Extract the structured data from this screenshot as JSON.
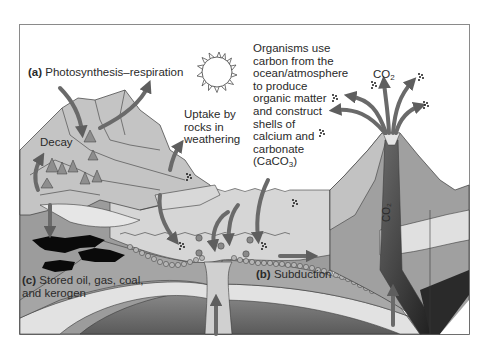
{
  "figure": {
    "type": "carbon-cycle-diagram",
    "palette": {
      "background": "#ffffff",
      "frame": "#8a8a8a",
      "rock_light": "#c8c8c8",
      "rock_mid": "#a9a9a9",
      "rock_dark": "#8c8c8c",
      "ocean": "#d4d4d4",
      "sediment": "#9a9a9a",
      "mantle": "#6e6e6e",
      "crust_band": "#e4e4e4",
      "arrow": "#6a6a6a",
      "oil": "#0a0a0a",
      "outline": "#3a3a3a",
      "text": "#2a2a2a"
    }
  },
  "labels": {
    "a_tag": "(a)",
    "a_text": "Photosynthesis–respiration",
    "decay": "Decay",
    "uptake": [
      "Uptake by",
      "rocks in",
      "weathering"
    ],
    "organisms": [
      "Organisms use",
      "carbon from the",
      "ocean/atmosphere",
      "to produce",
      "organic matter",
      "and construct",
      "shells of",
      "calcium and",
      "carbonate"
    ],
    "caco3_pre": "(CaCO",
    "caco3_sub": "3",
    "caco3_post": ")",
    "co2_main": "CO",
    "co2_sub": "2",
    "co2_vertical": "CO₂",
    "b_tag": "(b)",
    "b_text": "Subduction",
    "c_tag": "(c)",
    "c_line1": "Stored oil, gas, coal,",
    "c_line2": "and kerogen"
  }
}
